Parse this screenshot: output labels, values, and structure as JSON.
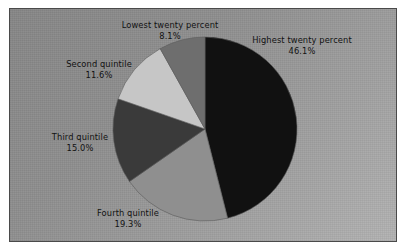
{
  "chart_data": {
    "type": "pie",
    "title": "",
    "subtitle": "",
    "xlabel": "",
    "ylabel": "",
    "grid": false,
    "legend_position": "none",
    "labels_inline": true,
    "start_angle_deg": 0,
    "direction": "clockwise",
    "categories": [
      "Highest twenty percent",
      "Fourth quintile",
      "Third quintile",
      "Second quintile",
      "Lowest twenty percent"
    ],
    "values": [
      46.1,
      19.3,
      15.0,
      11.6,
      8.1
    ],
    "value_labels": [
      "46.1%",
      "19.3%",
      "15.0%",
      "11.6%",
      "8.1%"
    ],
    "unit": "percent",
    "total": 100.1,
    "slices": [
      {
        "name": "Highest twenty percent",
        "value": 46.1,
        "value_label": "46.1%",
        "color": "#111111",
        "start_deg": 0,
        "end_deg": 165.96
      },
      {
        "name": "Fourth quintile",
        "value": 19.3,
        "value_label": "19.3%",
        "color": "#8f8f8f",
        "start_deg": 165.96,
        "end_deg": 235.44
      },
      {
        "name": "Third quintile",
        "value": 15.0,
        "value_label": "15.0%",
        "color": "#3a3a3a",
        "start_deg": 235.44,
        "end_deg": 289.44
      },
      {
        "name": "Second quintile",
        "value": 11.6,
        "value_label": "11.6%",
        "color": "#c6c6c6",
        "start_deg": 289.44,
        "end_deg": 331.2
      },
      {
        "name": "Lowest twenty percent",
        "value": 8.1,
        "value_label": "8.1%",
        "color": "#6e6e6e",
        "start_deg": 331.2,
        "end_deg": 360
      }
    ],
    "colors": [
      "#111111",
      "#8f8f8f",
      "#3a3a3a",
      "#c6c6c6",
      "#6e6e6e"
    ],
    "background_color": "#949494",
    "border_color": "#4a4a4a",
    "text_color": "#121212"
  },
  "labels": {
    "lowest": {
      "name": "Lowest twenty percent",
      "value": "8.1%"
    },
    "second": {
      "name": "Second quintile",
      "value": "11.6%"
    },
    "third": {
      "name": "Third quintile",
      "value": "15.0%"
    },
    "fourth": {
      "name": "Fourth quintile",
      "value": "19.3%"
    },
    "highest": {
      "name": "Highest twenty percent",
      "value": "46.1%"
    }
  }
}
